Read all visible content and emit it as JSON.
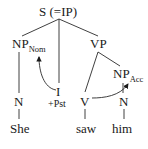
{
  "diagram": {
    "type": "syntax-tree",
    "nodes": {
      "root": "S (=IP)",
      "np_subject": {
        "label": "NP",
        "subscript": "Nom"
      },
      "infl": "I",
      "infl_feature": "+Pst",
      "vp": "VP",
      "np_object": {
        "label": "NP",
        "subscript": "Acc"
      },
      "n_subject": "N",
      "verb": "V",
      "n_object": "N"
    },
    "words": {
      "subject": "She",
      "verb": "saw",
      "object": "him"
    },
    "arrows": [
      {
        "from": "I",
        "to": "NP_Nom",
        "meaning": "nominative case assignment"
      },
      {
        "from": "V",
        "to": "NP_Acc",
        "meaning": "accusative case assignment"
      }
    ],
    "colors": {
      "ink": "#1a1a1a",
      "background": "#ffffff"
    }
  }
}
